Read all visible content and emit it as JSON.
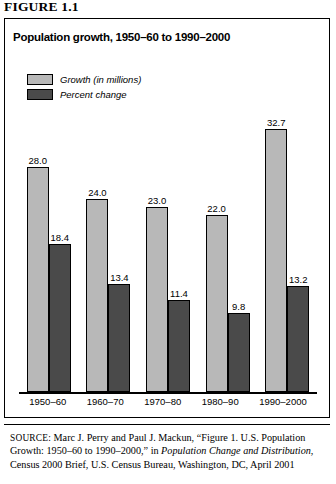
{
  "figure": {
    "label": "FIGURE 1.1"
  },
  "chart_data": {
    "type": "bar",
    "title": "Population growth, 1950–60 to 1990–2000",
    "xlabel": "",
    "ylabel": "",
    "ylim": [
      0,
      35
    ],
    "grid": false,
    "legend_position": "top-left",
    "categories": [
      "1950–60",
      "1960–70",
      "1970–80",
      "1980–90",
      "1990–2000"
    ],
    "series": [
      {
        "name": "Growth (in millions)",
        "color": "#b8b8b8",
        "values": [
          28.0,
          24.0,
          23.0,
          22.0,
          32.7
        ],
        "labels": [
          "28.0",
          "24.0",
          "23.0",
          "22.0",
          "32.7"
        ]
      },
      {
        "name": "Percent change",
        "color": "#4a4a4a",
        "values": [
          18.4,
          13.4,
          11.4,
          9.8,
          13.2
        ],
        "labels": [
          "18.4",
          "13.4",
          "11.4",
          "9.8",
          "13.2"
        ]
      }
    ]
  },
  "legend": {
    "items": [
      {
        "label": "Growth (in millions)",
        "color": "#b8b8b8"
      },
      {
        "label": "Percent change",
        "color": "#4a4a4a"
      }
    ]
  },
  "source": {
    "label": "SOURCE:",
    "part1": " Marc J. Perry and Paul J. Mackun, “Figure 1. U.S. Population Growth: 1950–60 to 1990–2000,” in ",
    "italic1": "Population Change and Distribution",
    "part2": ", Census 2000 Brief, U.S. Census Bureau, Washington, DC, April 2001"
  }
}
